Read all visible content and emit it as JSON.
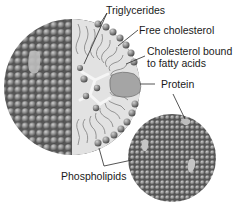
{
  "labels": {
    "triglycerides": "Triglycerides",
    "free_cholesterol": "Free cholesterol",
    "cholesterol_bound_line1": "Cholesterol bound",
    "cholesterol_bound_line2": "to fatty acids",
    "protein": "Protein",
    "phospholipids": "Phospholipids"
  },
  "colors": {
    "sphere": "#8a8a8a",
    "sphere_highlight": "#c8c8c8",
    "sphere_shadow": "#4a4a4a",
    "core": "#d9d9d9",
    "protein": "#a8a8a8",
    "leader_line": "#333333"
  },
  "figures": [
    {
      "name": "large-lipoprotein",
      "cx": 72,
      "cy": 87,
      "r": 68,
      "cutaway": true
    },
    {
      "name": "small-lipoprotein",
      "cx": 172,
      "cy": 158,
      "r": 44,
      "cutaway": false
    }
  ]
}
